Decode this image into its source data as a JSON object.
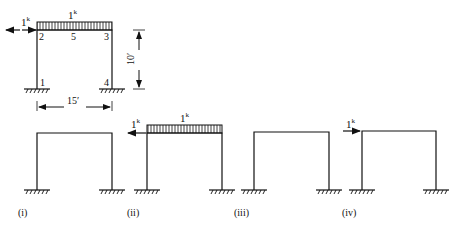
{
  "main_frame": {
    "top_load_label": "1",
    "top_load_sup": "k",
    "lateral_load_label": "1",
    "lateral_load_sup": "k",
    "nodes": [
      "1",
      "2",
      "3",
      "4",
      "5"
    ],
    "height_dim": "10′",
    "span_dim": "15′"
  },
  "cases": [
    {
      "label": "(i)"
    },
    {
      "label": "(ii)",
      "lateral_load_label": "1",
      "lateral_load_sup": "k",
      "top_load_label": "1",
      "top_load_sup": "k"
    },
    {
      "label": "(iii)"
    },
    {
      "label": "(iv)",
      "lateral_load_label": "1",
      "lateral_load_sup": "k"
    }
  ],
  "colors": {
    "line": "#111111",
    "background": "#ffffff"
  }
}
